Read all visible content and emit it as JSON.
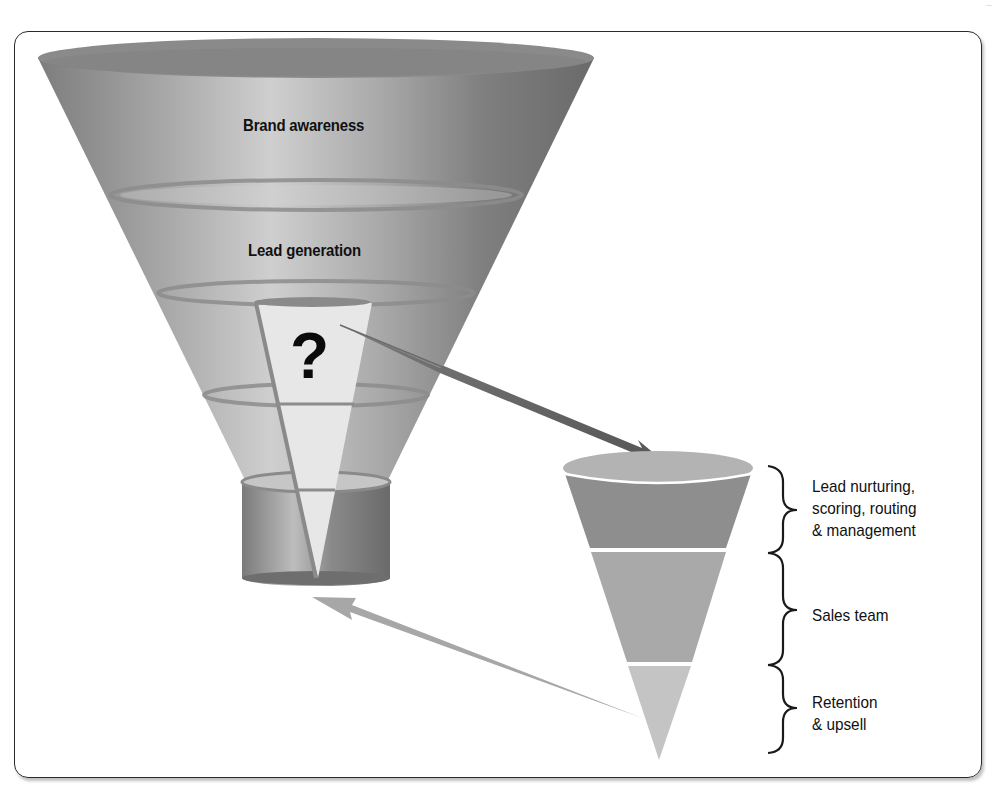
{
  "corner_mark": "...",
  "big_funnel": {
    "stages": [
      {
        "label": "Brand awareness"
      },
      {
        "label": "Lead generation"
      }
    ],
    "gap_marker": "?"
  },
  "small_funnel": {
    "stages": [
      {
        "label_lines": [
          "Lead nurturing,",
          "scoring, routing",
          "& management"
        ]
      },
      {
        "label_lines": [
          "Sales team"
        ]
      },
      {
        "label_lines": [
          "Retention",
          "& upsell"
        ]
      }
    ]
  },
  "arrows": [
    {
      "name": "handoff-arrow",
      "from": "gap",
      "to": "small-funnel-top"
    },
    {
      "name": "feedback-arrow",
      "from": "small-funnel-bottom",
      "to": "big-funnel-neck"
    }
  ],
  "colors": {
    "frame": "#2a2a2a",
    "funnel_dark": "#6e6e6e",
    "funnel_mid": "#9a9a9a",
    "funnel_light": "#c9c9c9",
    "slice": "#e6e6e6",
    "small_band_1": "#8c8c8c",
    "small_band_2": "#a9a9a9",
    "small_band_3": "#c3c3c3",
    "arrow_dark": "#5e5e5e",
    "arrow_light": "#a8a8a8"
  }
}
